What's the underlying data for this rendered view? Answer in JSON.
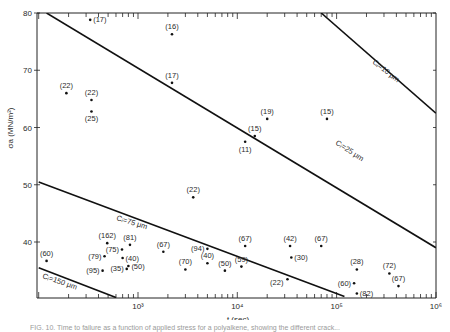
{
  "chart_data": {
    "type": "scatter",
    "title": "",
    "xlabel": "t (sec)",
    "ylabel": "σa (MN/m²)",
    "xscale": "log",
    "xlim": [
      100,
      1000000
    ],
    "ylim": [
      30,
      80
    ],
    "x_ticks": [
      {
        "value": 1000,
        "label": "10³"
      },
      {
        "value": 10000,
        "label": "10⁴"
      },
      {
        "value": 100000,
        "label": "10⁵"
      },
      {
        "value": 1000000,
        "label": "10⁶"
      }
    ],
    "y_ticks": [
      {
        "value": 80,
        "label": "80"
      },
      {
        "value": 70,
        "label": "70"
      },
      {
        "value": 60,
        "label": "60"
      },
      {
        "value": 50,
        "label": "50"
      },
      {
        "value": 40,
        "label": "40"
      }
    ],
    "grid": false,
    "lines": [
      {
        "name": "Ci = 10 μm",
        "x": [
          70000,
          1000000
        ],
        "y": [
          80,
          62.5
        ]
      },
      {
        "name": "Ci = 25 μm",
        "x": [
          120,
          1000000
        ],
        "y": [
          80,
          39
        ]
      },
      {
        "name": "Ci = 75 μm",
        "x": [
          100,
          120000
        ],
        "y": [
          50.5,
          30.5
        ]
      },
      {
        "name": "Ci = 150 μm",
        "x": [
          100,
          600
        ],
        "y": [
          35.5,
          30.3
        ]
      }
    ],
    "points": [
      {
        "t": 330,
        "sigma": 78.8,
        "label": "(17)"
      },
      {
        "t": 2200,
        "sigma": 76.3,
        "label": "(16)"
      },
      {
        "t": 2200,
        "sigma": 67.8,
        "label": "(17)"
      },
      {
        "t": 190,
        "sigma": 66.0,
        "label": "(22)"
      },
      {
        "t": 340,
        "sigma": 64.8,
        "label": "(22)"
      },
      {
        "t": 340,
        "sigma": 62.8,
        "label": "(25)"
      },
      {
        "t": 20000,
        "sigma": 61.5,
        "label": "(19)"
      },
      {
        "t": 80000,
        "sigma": 61.5,
        "label": "(15)"
      },
      {
        "t": 15000,
        "sigma": 58.5,
        "label": "(15)"
      },
      {
        "t": 12000,
        "sigma": 57.5,
        "label": "(11)"
      },
      {
        "t": 3600,
        "sigma": 47.8,
        "label": "(22)"
      },
      {
        "t": 120,
        "sigma": 36.7,
        "label": "(60)"
      },
      {
        "t": 440,
        "sigma": 35.0,
        "label": "(95)"
      },
      {
        "t": 490,
        "sigma": 39.8,
        "label": "(162)"
      },
      {
        "t": 460,
        "sigma": 37.5,
        "label": "(79)"
      },
      {
        "t": 690,
        "sigma": 38.7,
        "label": "(75)"
      },
      {
        "t": 830,
        "sigma": 39.5,
        "label": "(81)"
      },
      {
        "t": 700,
        "sigma": 37.2,
        "label": "(40)"
      },
      {
        "t": 770,
        "sigma": 35.3,
        "label": "(35)"
      },
      {
        "t": 800,
        "sigma": 35.8,
        "label": "(50)"
      },
      {
        "t": 1800,
        "sigma": 38.3,
        "label": "(67)"
      },
      {
        "t": 3000,
        "sigma": 35.2,
        "label": "(70)"
      },
      {
        "t": 5000,
        "sigma": 38.8,
        "label": "(94)"
      },
      {
        "t": 5000,
        "sigma": 36.3,
        "label": "(40)"
      },
      {
        "t": 7500,
        "sigma": 35.0,
        "label": "(50)"
      },
      {
        "t": 11000,
        "sigma": 35.7,
        "label": "(59)"
      },
      {
        "t": 12000,
        "sigma": 39.3,
        "label": "(67)"
      },
      {
        "t": 32000,
        "sigma": 33.5,
        "label": "(22)"
      },
      {
        "t": 34000,
        "sigma": 39.3,
        "label": "(42)"
      },
      {
        "t": 35000,
        "sigma": 37.3,
        "label": "(30)"
      },
      {
        "t": 70000,
        "sigma": 39.3,
        "label": "(67)"
      },
      {
        "t": 160000,
        "sigma": 35.2,
        "label": "(28)"
      },
      {
        "t": 150000,
        "sigma": 32.8,
        "label": "(60)"
      },
      {
        "t": 160000,
        "sigma": 31.0,
        "label": "(82)"
      },
      {
        "t": 340000,
        "sigma": 34.5,
        "label": "(72)"
      },
      {
        "t": 420000,
        "sigma": 32.3,
        "label": "(67)"
      }
    ],
    "line_labels": [
      {
        "text": "Cᵢ=10 μm"
      },
      {
        "text": "Cᵢ=25 μm"
      },
      {
        "text": "Cᵢ=75 μm"
      },
      {
        "text": "Cᵢ=150 μm"
      }
    ]
  },
  "caption": "FIG. 10. Time to failure as a function of applied stress for a polyalkene, showing the different crack..."
}
